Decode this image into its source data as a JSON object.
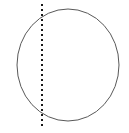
{
  "canvas": {
    "width": 129,
    "height": 133,
    "background_color": "#ffffff"
  },
  "figure": {
    "title": ""
  },
  "chart_data": {
    "type": "diagram",
    "title": "",
    "shapes": [
      {
        "name": "circle",
        "kind": "ellipse",
        "center_x": 68,
        "center_y": 65,
        "radius_x": 51,
        "radius_y": 56,
        "stroke_color": "#595959",
        "stroke_width": 1,
        "fill": "none"
      },
      {
        "name": "vertical-dotted-chord",
        "kind": "line",
        "x1": 42,
        "y1": 4,
        "x2": 42,
        "y2": 129,
        "stroke_color": "#1a1a1a",
        "stroke_width": 2,
        "dash_pattern": "2 3",
        "orientation": "vertical"
      }
    ],
    "annotations": []
  }
}
